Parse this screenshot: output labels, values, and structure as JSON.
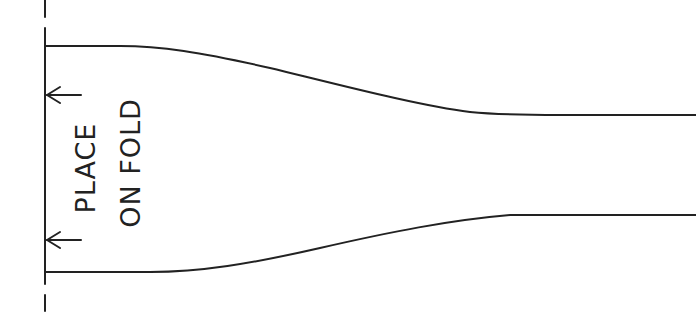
{
  "diagram": {
    "type": "sewing-pattern-piece",
    "stroke_color": "#222222",
    "background": "#ffffff",
    "fold_line": {
      "style": "dash-solid-dash",
      "label_lines": [
        "PLACE",
        "ON FOLD"
      ]
    },
    "labels": {
      "line1": "PLACE",
      "line2": "ON FOLD"
    },
    "arrows": [
      {
        "direction": "left",
        "position": "upper"
      },
      {
        "direction": "left",
        "position": "lower"
      }
    ],
    "outline": {
      "description": "Piece widest at fold edge, tapering with smooth curves to a narrower straight band on the right"
    }
  }
}
